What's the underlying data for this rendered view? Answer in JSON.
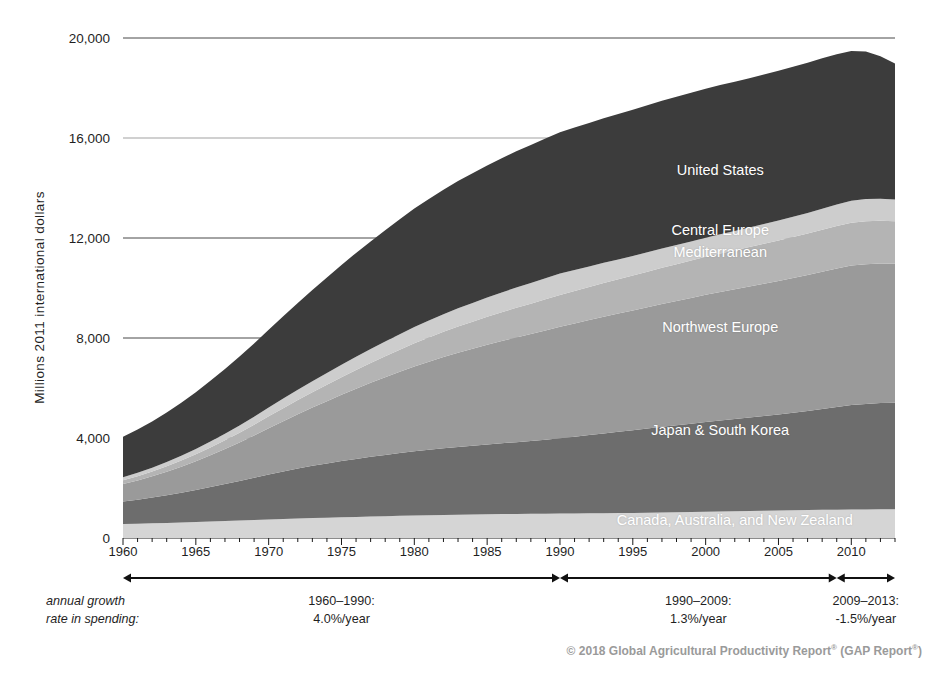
{
  "chart_data": {
    "type": "area",
    "stacked": true,
    "title": "",
    "subtitle": "",
    "xlabel": "",
    "ylabel": "Millions 2011 international dollars",
    "xlim": [
      1960,
      2013
    ],
    "ylim": [
      0,
      20000
    ],
    "yticks": [
      0,
      4000,
      8000,
      12000,
      16000,
      20000
    ],
    "ytick_labels": [
      "0",
      "4,000",
      "8,000",
      "12,000",
      "16,000",
      "20,000"
    ],
    "xticks": [
      1960,
      1965,
      1970,
      1975,
      1980,
      1985,
      1990,
      1995,
      2000,
      2005,
      2010
    ],
    "xtick_labels": [
      "1960",
      "1965",
      "1970",
      "1975",
      "1980",
      "1985",
      "1990",
      "1995",
      "2000",
      "2005",
      "2010"
    ],
    "minor_xtick_step": 1,
    "grid": "horizontal-major-only",
    "legend_position": "inline-on-bands",
    "x": [
      1960,
      1961,
      1962,
      1963,
      1964,
      1965,
      1966,
      1967,
      1968,
      1969,
      1970,
      1971,
      1972,
      1973,
      1974,
      1975,
      1976,
      1977,
      1978,
      1979,
      1980,
      1981,
      1982,
      1983,
      1984,
      1985,
      1986,
      1987,
      1988,
      1989,
      1990,
      1991,
      1992,
      1993,
      1994,
      1995,
      1996,
      1997,
      1998,
      1999,
      2000,
      2001,
      2002,
      2003,
      2004,
      2005,
      2006,
      2007,
      2008,
      2009,
      2010,
      2011,
      2012,
      2013
    ],
    "series": [
      {
        "name": "Canada, Australia, and New Zealand",
        "color": "#d5d5d5",
        "label_color": "#ffffff",
        "values": [
          560,
          575,
          590,
          605,
          620,
          640,
          660,
          680,
          700,
          720,
          745,
          765,
          785,
          800,
          815,
          830,
          845,
          860,
          875,
          890,
          905,
          915,
          925,
          935,
          945,
          955,
          960,
          965,
          970,
          975,
          980,
          985,
          990,
          995,
          1000,
          1005,
          1010,
          1020,
          1030,
          1040,
          1050,
          1060,
          1070,
          1080,
          1090,
          1100,
          1110,
          1120,
          1130,
          1135,
          1140,
          1145,
          1150,
          1150
        ]
      },
      {
        "name": "Japan & South Korea",
        "color": "#6d6d6d",
        "label_color": "#ffffff",
        "values": [
          900,
          960,
          1030,
          1110,
          1190,
          1280,
          1380,
          1480,
          1580,
          1690,
          1800,
          1900,
          2000,
          2090,
          2170,
          2250,
          2320,
          2390,
          2450,
          2510,
          2570,
          2620,
          2670,
          2710,
          2750,
          2790,
          2830,
          2870,
          2910,
          2960,
          3010,
          3070,
          3130,
          3190,
          3250,
          3310,
          3370,
          3430,
          3480,
          3530,
          3590,
          3640,
          3690,
          3740,
          3790,
          3840,
          3900,
          3960,
          4030,
          4110,
          4180,
          4220,
          4250,
          4260
        ]
      },
      {
        "name": "Northwest Europe",
        "color": "#9a9a9a",
        "label_color": "#ffffff",
        "values": [
          700,
          770,
          850,
          940,
          1040,
          1150,
          1270,
          1400,
          1540,
          1690,
          1850,
          2010,
          2170,
          2330,
          2490,
          2650,
          2810,
          2960,
          3110,
          3250,
          3390,
          3520,
          3650,
          3770,
          3880,
          3990,
          4090,
          4190,
          4280,
          4370,
          4460,
          4530,
          4600,
          4670,
          4730,
          4790,
          4850,
          4910,
          4970,
          5030,
          5090,
          5140,
          5190,
          5240,
          5290,
          5340,
          5390,
          5440,
          5490,
          5540,
          5580,
          5590,
          5580,
          5560
        ]
      },
      {
        "name": "Mediterranean",
        "color": "#b4b4b4",
        "label_color": "#ffffff",
        "values": [
          150,
          170,
          195,
          220,
          250,
          280,
          315,
          350,
          390,
          430,
          475,
          520,
          565,
          610,
          655,
          700,
          745,
          790,
          835,
          880,
          925,
          965,
          1005,
          1045,
          1080,
          1115,
          1150,
          1185,
          1215,
          1245,
          1275,
          1300,
          1325,
          1350,
          1375,
          1400,
          1425,
          1450,
          1475,
          1500,
          1525,
          1545,
          1565,
          1585,
          1605,
          1625,
          1645,
          1665,
          1685,
          1700,
          1715,
          1720,
          1710,
          1700
        ]
      },
      {
        "name": "Central Europe",
        "color": "#cdcdcd",
        "label_color": "#ffffff",
        "values": [
          120,
          135,
          150,
          170,
          190,
          215,
          240,
          265,
          295,
          325,
          355,
          385,
          415,
          445,
          475,
          505,
          535,
          565,
          595,
          625,
          655,
          680,
          705,
          730,
          750,
          770,
          790,
          810,
          825,
          840,
          855,
          840,
          820,
          805,
          790,
          780,
          775,
          770,
          765,
          760,
          760,
          765,
          770,
          775,
          785,
          795,
          805,
          820,
          840,
          860,
          880,
          885,
          880,
          875
        ]
      },
      {
        "name": "United States",
        "color": "#3c3c3c",
        "label_color": "#ffffff",
        "values": [
          1620,
          1730,
          1850,
          1980,
          2120,
          2270,
          2430,
          2590,
          2760,
          2930,
          3110,
          3290,
          3470,
          3650,
          3820,
          3990,
          4150,
          4300,
          4450,
          4600,
          4740,
          4860,
          4980,
          5090,
          5190,
          5280,
          5370,
          5450,
          5520,
          5590,
          5650,
          5700,
          5740,
          5780,
          5820,
          5850,
          5880,
          5910,
          5930,
          5950,
          5960,
          5970,
          5970,
          5970,
          5980,
          5990,
          6000,
          6010,
          6020,
          6010,
          5990,
          5900,
          5700,
          5440
        ]
      }
    ],
    "band_labels": [
      {
        "name": "United States",
        "x": 2001,
        "y": 14700
      },
      {
        "name": "Central Europe",
        "x": 2001,
        "y": 12300
      },
      {
        "name": "Mediterranean",
        "x": 2001,
        "y": 11400
      },
      {
        "name": "Northwest Europe",
        "x": 2001,
        "y": 8400
      },
      {
        "name": "Japan & South Korea",
        "x": 2001,
        "y": 4300
      },
      {
        "name": "Canada, Australia, and New Zealand",
        "x": 2002,
        "y": 700
      }
    ]
  },
  "annotations": {
    "growth_caption_line1": "annual growth",
    "growth_caption_line2": "rate in spending:",
    "segments": [
      {
        "period": "1960–1990:",
        "rate": "4.0%/year",
        "start_year": 1960,
        "end_year": 1990
      },
      {
        "period": "1990–2009:",
        "rate": "1.3%/year",
        "start_year": 1990,
        "end_year": 2009
      },
      {
        "period": "2009–2013:",
        "rate": "-1.5%/year",
        "start_year": 2009,
        "end_year": 2013
      }
    ]
  },
  "footer": {
    "copyright_symbol": "©",
    "year": "2018",
    "text": "© 2018 Global Agricultural Productivity Report",
    "mark1": "®",
    "text2": " (GAP Report",
    "mark2": "®",
    "text3": ")"
  }
}
